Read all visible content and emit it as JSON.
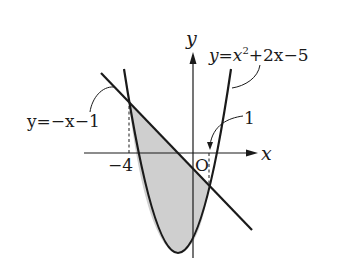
{
  "figure": {
    "axes": {
      "x_label": "x",
      "y_label": "y",
      "origin_label": "O"
    },
    "curves": {
      "parabola": {
        "equation_label_prefix": "y=x",
        "equation_label_exp": "2",
        "equation_label_suffix": "+2x−5",
        "equation": "y = x^2 + 2x - 5"
      },
      "line": {
        "equation_label": "y=−x−1",
        "equation": "y = -x - 1"
      }
    },
    "tick_labels": {
      "left_intersection_x": "−4",
      "right_intersection_x": "1"
    },
    "shaded_region": "area between y=-x-1 and y=x^2+2x-5 for -4 <= x <= 1",
    "colors": {
      "stroke": "#1a1a1a",
      "shade": "#cfcfcf",
      "background": "#ffffff"
    }
  }
}
